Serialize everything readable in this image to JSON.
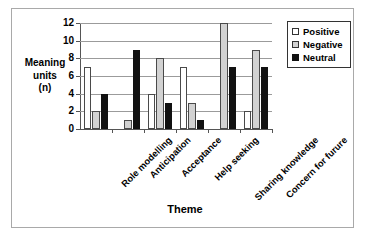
{
  "chart_data": {
    "type": "bar",
    "title": "",
    "xlabel": "Theme",
    "ylabel": "Meaning units (n)",
    "ylabel_lines": [
      "Meaning",
      "units",
      "(n)"
    ],
    "ylim": [
      0,
      12
    ],
    "yticks": [
      0,
      2,
      4,
      6,
      8,
      10,
      12
    ],
    "ytick_labels": [
      "0",
      "2",
      "4",
      "6",
      "8",
      "10",
      "12"
    ],
    "grid": true,
    "legend_position": "right",
    "categories": [
      "Role modelling",
      "Anticipation",
      "Acceptance",
      "Help seeking",
      "Sharing knowledge",
      "Concern for furure"
    ],
    "series": [
      {
        "name": "Positive",
        "color": "#ffffff",
        "values": [
          7,
          0,
          4,
          7,
          0,
          2
        ]
      },
      {
        "name": "Negative",
        "color": "#d2d2d2",
        "values": [
          2,
          1,
          8,
          3,
          12,
          9
        ]
      },
      {
        "name": "Neutral",
        "color": "#111111",
        "values": [
          4,
          9,
          3,
          1,
          7,
          7
        ]
      }
    ]
  },
  "legend": {
    "items": [
      {
        "label": "Positive",
        "swatch": "positive"
      },
      {
        "label": "Negative",
        "swatch": "negative"
      },
      {
        "label": "Neutral",
        "swatch": "neutral"
      }
    ]
  }
}
